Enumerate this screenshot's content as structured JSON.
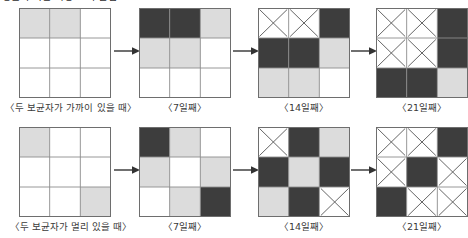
{
  "heading": {
    "text": "병균의 확산 과정 모의 실험"
  },
  "colors": {
    "empty": "#ffffff",
    "infected_light": "#dcdcdc",
    "infected_dark": "#3d3d3d",
    "cross": "#ffffff",
    "cross_stroke": "#555555",
    "grid_line": "#8c8c8c",
    "border": "#6e6e6e",
    "arrow": "#333333",
    "text": "#3a3a3a"
  },
  "legend": {
    "empty_label": "건강한 사람",
    "light_label": "보균자",
    "dark_label": "발병자",
    "cross_label": "사망"
  },
  "arrows": {
    "glyph": "arrow-right-icon",
    "count": 3
  },
  "rows": [
    {
      "id": "row-near",
      "caption": "〈두 보균자가 가까이 있을 때〉",
      "panels": [
        {
          "id": "near-day0",
          "caption": "〈두 보균자가 가까이 있을 때〉",
          "caption_visible": true,
          "cells": [
            [
              "light",
              "light",
              "empty"
            ],
            [
              "empty",
              "empty",
              "empty"
            ],
            [
              "empty",
              "empty",
              "empty"
            ]
          ]
        },
        {
          "id": "near-day7",
          "caption": "〈7일째〉",
          "caption_visible": true,
          "cells": [
            [
              "dark",
              "dark",
              "light"
            ],
            [
              "light",
              "light",
              "empty"
            ],
            [
              "empty",
              "empty",
              "empty"
            ]
          ]
        },
        {
          "id": "near-day14",
          "caption": "〈14일째〉",
          "caption_visible": true,
          "cells": [
            [
              "cross",
              "cross",
              "dark"
            ],
            [
              "dark",
              "dark",
              "light"
            ],
            [
              "light",
              "light",
              "empty"
            ]
          ]
        },
        {
          "id": "near-day21",
          "caption": "〈21일째〉",
          "caption_visible": true,
          "cells": [
            [
              "cross",
              "cross",
              "dark"
            ],
            [
              "cross",
              "cross",
              "dark"
            ],
            [
              "dark",
              "dark",
              "light"
            ]
          ]
        }
      ]
    },
    {
      "id": "row-far",
      "caption": "〈두 보균자가 멀리 있을 때〉",
      "panels": [
        {
          "id": "far-day0",
          "caption": "〈두 보균자가 멀리 있을 때〉",
          "caption_visible": true,
          "cells": [
            [
              "light",
              "empty",
              "empty"
            ],
            [
              "empty",
              "empty",
              "empty"
            ],
            [
              "empty",
              "empty",
              "light"
            ]
          ]
        },
        {
          "id": "far-day7",
          "caption": "〈7일째〉",
          "caption_visible": true,
          "cells": [
            [
              "dark",
              "light",
              "empty"
            ],
            [
              "light",
              "empty",
              "light"
            ],
            [
              "empty",
              "light",
              "dark"
            ]
          ]
        },
        {
          "id": "far-day14",
          "caption": "〈14일째〉",
          "caption_visible": true,
          "cells": [
            [
              "cross",
              "dark",
              "light"
            ],
            [
              "dark",
              "light",
              "dark"
            ],
            [
              "light",
              "dark",
              "cross"
            ]
          ]
        },
        {
          "id": "far-day21",
          "caption": "〈21일째〉",
          "caption_visible": true,
          "cells": [
            [
              "cross",
              "cross",
              "dark"
            ],
            [
              "cross",
              "dark",
              "cross"
            ],
            [
              "dark",
              "cross",
              "cross"
            ]
          ]
        }
      ]
    }
  ]
}
